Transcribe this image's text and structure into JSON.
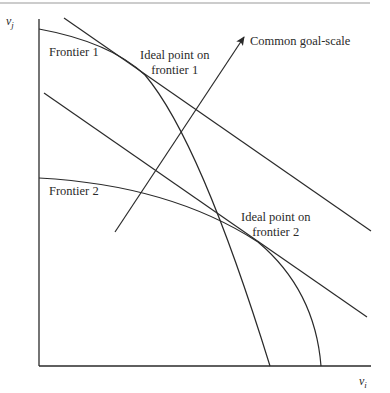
{
  "labels": {
    "y_axis": "v",
    "y_axis_sub": "j",
    "x_axis": "v",
    "x_axis_sub": "i",
    "frontier1": "Frontier 1",
    "frontier2": "Frontier 2",
    "ideal1_line1": "Ideal point on",
    "ideal1_line2": "frontier 1",
    "ideal2_line1": "Ideal point on",
    "ideal2_line2": "frontier 2",
    "goal_scale": "Common goal-scale"
  },
  "colors": {
    "stroke": "#2a2a2a",
    "rule": "#888888"
  }
}
